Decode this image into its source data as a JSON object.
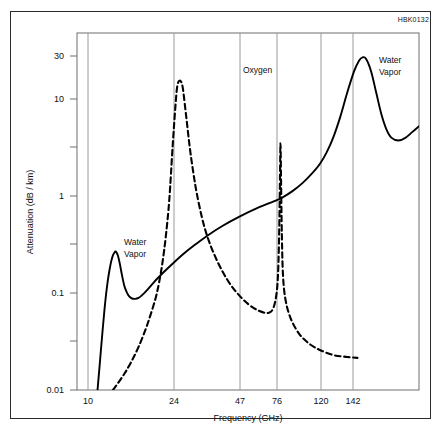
{
  "figure": {
    "id_label": "HBK0132",
    "border_color": "#2b2b2b",
    "background": "#ffffff"
  },
  "chart_data": {
    "type": "line",
    "title": "",
    "subtitle": "",
    "xlabel": "Frequency (GHz)",
    "ylabel": "Attenuation (dB / km)",
    "xscale": "linear",
    "yscale": "log",
    "xlim": [
      0,
      200
    ],
    "ylim": [
      0.01,
      50
    ],
    "grid": "vertical-only",
    "legend_position": "inline-annotations",
    "x_ticks": [
      10,
      24,
      47,
      76,
      120,
      142
    ],
    "x_tick_labels": [
      "10",
      "24",
      "47",
      "76",
      "120",
      "142"
    ],
    "y_ticks": [
      0.01,
      0.03,
      0.1,
      0.3,
      1,
      3,
      10,
      30
    ],
    "y_tick_labels": [
      "0.01",
      "",
      "0.1",
      "",
      "1",
      "",
      "10",
      "30"
    ],
    "y_major_labels": [
      "30",
      "10",
      "1",
      "0.1",
      "0.01"
    ],
    "annotations": [
      {
        "text": "Water Vapor",
        "lines": [
          "Water",
          "Vapor"
        ],
        "x": 16,
        "y": 0.45,
        "series": "water-vapor"
      },
      {
        "text": "Oxygen",
        "lines": [
          "Oxygen"
        ],
        "x": 57,
        "y": 24,
        "series": "oxygen"
      },
      {
        "text": "Water Vapor",
        "lines": [
          "Water",
          "Vapor"
        ],
        "x": 176,
        "y": 20,
        "series": "water-vapor"
      }
    ],
    "series": [
      {
        "name": "Water Vapor",
        "style": "solid",
        "color": "#000000",
        "points": [
          [
            12.0,
            0.01
          ],
          [
            13.0,
            0.016
          ],
          [
            14.0,
            0.026
          ],
          [
            15.0,
            0.042
          ],
          [
            16.0,
            0.066
          ],
          [
            17.0,
            0.098
          ],
          [
            18.0,
            0.135
          ],
          [
            19.0,
            0.175
          ],
          [
            20.0,
            0.215
          ],
          [
            21.0,
            0.248
          ],
          [
            22.0,
            0.268
          ],
          [
            22.5,
            0.272
          ],
          [
            23.0,
            0.268
          ],
          [
            24.0,
            0.245
          ],
          [
            25.0,
            0.205
          ],
          [
            26.0,
            0.165
          ],
          [
            27.0,
            0.135
          ],
          [
            28.0,
            0.115
          ],
          [
            30.0,
            0.096
          ],
          [
            32.0,
            0.089
          ],
          [
            34.0,
            0.088
          ],
          [
            36.0,
            0.09
          ],
          [
            38.0,
            0.096
          ],
          [
            40.0,
            0.104
          ],
          [
            44.0,
            0.125
          ],
          [
            47.0,
            0.143
          ],
          [
            52.0,
            0.175
          ],
          [
            57.0,
            0.212
          ],
          [
            62.0,
            0.255
          ],
          [
            68.0,
            0.31
          ],
          [
            76.0,
            0.395
          ],
          [
            85.0,
            0.5
          ],
          [
            95.0,
            0.625
          ],
          [
            105.0,
            0.76
          ],
          [
            115.0,
            0.9
          ],
          [
            120.0,
            0.985
          ],
          [
            126.0,
            1.15
          ],
          [
            132.0,
            1.4
          ],
          [
            138.0,
            1.8
          ],
          [
            142.0,
            2.2
          ],
          [
            146.0,
            2.9
          ],
          [
            150.0,
            4.2
          ],
          [
            154.0,
            6.8
          ],
          [
            158.0,
            12.0
          ],
          [
            162.0,
            20.0
          ],
          [
            165.0,
            26.0
          ],
          [
            167.0,
            28.0
          ],
          [
            169.0,
            27.0
          ],
          [
            172.0,
            20.0
          ],
          [
            175.0,
            12.0
          ],
          [
            178.0,
            7.2
          ],
          [
            181.0,
            5.0
          ],
          [
            184.0,
            4.1
          ],
          [
            188.0,
            3.85
          ],
          [
            192.0,
            4.1
          ],
          [
            196.0,
            4.7
          ],
          [
            200.0,
            5.4
          ]
        ]
      },
      {
        "name": "Oxygen",
        "style": "dashed",
        "color": "#000000",
        "points": [
          [
            21.0,
            0.01
          ],
          [
            24.0,
            0.0118
          ],
          [
            28.0,
            0.015
          ],
          [
            32.0,
            0.02
          ],
          [
            36.0,
            0.028
          ],
          [
            40.0,
            0.042
          ],
          [
            43.0,
            0.06
          ],
          [
            46.0,
            0.09
          ],
          [
            48.0,
            0.13
          ],
          [
            50.0,
            0.21
          ],
          [
            52.0,
            0.4
          ],
          [
            54.0,
            0.95
          ],
          [
            56.0,
            3.5
          ],
          [
            58.0,
            11.0
          ],
          [
            59.0,
            15.0
          ],
          [
            60.0,
            16.0
          ],
          [
            61.0,
            15.5
          ],
          [
            62.0,
            13.0
          ],
          [
            64.0,
            6.5
          ],
          [
            66.0,
            3.2
          ],
          [
            68.0,
            1.8
          ],
          [
            70.0,
            1.1
          ],
          [
            73.0,
            0.62
          ],
          [
            76.0,
            0.4
          ],
          [
            80.0,
            0.26
          ],
          [
            85.0,
            0.17
          ],
          [
            90.0,
            0.122
          ],
          [
            95.0,
            0.095
          ],
          [
            100.0,
            0.078
          ],
          [
            105.0,
            0.068
          ],
          [
            110.0,
            0.063
          ],
          [
            113.0,
            0.064
          ],
          [
            115.0,
            0.072
          ],
          [
            116.5,
            0.095
          ],
          [
            117.5,
            0.15
          ],
          [
            118.2,
            0.4
          ],
          [
            118.7,
            1.6
          ],
          [
            119.0,
            3.6
          ],
          [
            119.3,
            1.6
          ],
          [
            119.8,
            0.4
          ],
          [
            120.5,
            0.15
          ],
          [
            122.0,
            0.085
          ],
          [
            125.0,
            0.055
          ],
          [
            130.0,
            0.038
          ],
          [
            136.0,
            0.03
          ],
          [
            142.0,
            0.026
          ],
          [
            150.0,
            0.023
          ],
          [
            158.0,
            0.022
          ],
          [
            164.0,
            0.0215
          ]
        ]
      }
    ]
  },
  "axes": {
    "x_axis_name": "frequency-axis",
    "y_axis_name": "attenuation-axis"
  }
}
